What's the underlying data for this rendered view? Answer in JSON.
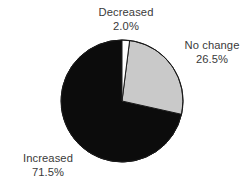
{
  "chart_data": {
    "type": "pie",
    "title": "",
    "subtitle": "",
    "xlabel": "",
    "ylabel": "",
    "legend_position": "none",
    "grid": false,
    "labels_outside": true,
    "start_angle_deg": 0,
    "direction": "clockwise",
    "categories": [
      "Decreased",
      "No change",
      "Increased"
    ],
    "values": [
      2.0,
      26.5,
      71.5
    ],
    "value_unit": "%",
    "slices": [
      {
        "label": "Decreased",
        "value": 2.0,
        "value_text": "2.0%",
        "color": "#ffffff",
        "start_deg": 0.0,
        "end_deg": 7.2
      },
      {
        "label": "No change",
        "value": 26.5,
        "value_text": "26.5%",
        "color": "#c9c9c9",
        "start_deg": 7.2,
        "end_deg": 102.6
      },
      {
        "label": "Increased",
        "value": 71.5,
        "value_text": "71.5%",
        "color": "#0c0c0c",
        "start_deg": 102.6,
        "end_deg": 360.0
      }
    ]
  },
  "geometry": {
    "center_x": 122,
    "center_y": 101,
    "radius": 61
  },
  "style": {
    "background": "#ffffff",
    "text_color": "#3a3a3a",
    "outline_color": "#1a1a1a",
    "slice_white": "#ffffff",
    "slice_gray": "#c9c9c9",
    "slice_black": "#0c0c0c"
  },
  "labels": {
    "decreased": {
      "name": "Decreased",
      "value": "2.0%"
    },
    "nochange": {
      "name": "No change",
      "value": "26.5%"
    },
    "increased": {
      "name": "Increased",
      "value": "71.5%"
    }
  }
}
